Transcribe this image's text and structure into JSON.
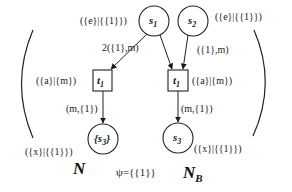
{
  "diagram": {
    "nets": [
      {
        "name": "N",
        "places": [
          {
            "id": "s1",
            "label": "s",
            "sub": "1",
            "marking": "({e}|{{1}})"
          },
          {
            "id": "s3",
            "label": "{s",
            "sub": "3",
            "label_suffix": "}",
            "marking": "({x}|{{1}})"
          }
        ],
        "transitions": [
          {
            "id": "t1",
            "label": "t",
            "sub": "1",
            "annotation": "({a}|{m})"
          }
        ],
        "arcs": [
          {
            "from": "s1",
            "to": "t1",
            "label": "2({1},m)"
          },
          {
            "from": "t1",
            "to": "s3",
            "label": "(m,{1})"
          }
        ]
      },
      {
        "name": "N",
        "name_sub": "B",
        "places": [
          {
            "id": "s2",
            "label": "s",
            "sub": "2",
            "marking": "({e}|{{1}})"
          },
          {
            "id": "s3",
            "label": "s",
            "sub": "3",
            "marking": "({x}|{{1}})"
          }
        ],
        "transitions": [
          {
            "id": "t1",
            "label": "t",
            "sub": "1",
            "annotation": "({a}|{m})"
          }
        ],
        "arcs": [
          {
            "from": "s1",
            "to": "t1",
            "label": ""
          },
          {
            "from": "s2",
            "to": "t1",
            "label": "({1},m)"
          },
          {
            "from": "t1",
            "to": "s3",
            "label": "(m,{1})"
          }
        ]
      }
    ],
    "psi": "ψ={{1}}"
  }
}
